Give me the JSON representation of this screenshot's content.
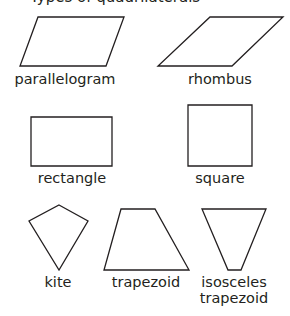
{
  "title": "Types of quadrilaterals",
  "stroke_color": "#231f20",
  "shapes": [
    {
      "name": "parallelogram",
      "label": "parallelogram",
      "points": "38,17 124,17 106,66 20,66",
      "label_x": 65,
      "label_y": 71
    },
    {
      "name": "rhombus",
      "label": "rhombus",
      "points": "210,17 283,17 232,66 158,66",
      "label_x": 220,
      "label_y": 71
    },
    {
      "name": "rectangle",
      "label": "rectangle",
      "points": "31,117 112,117 112,166 31,166",
      "label_x": 72,
      "label_y": 170
    },
    {
      "name": "square",
      "label": "square",
      "points": "188,105 252,105 252,166 188,166",
      "label_x": 220,
      "label_y": 170
    },
    {
      "name": "kite",
      "label": "kite",
      "points": "59,205 88,221 59,270 29,221",
      "label_x": 58,
      "label_y": 274
    },
    {
      "name": "trapezoid",
      "label": "trapezoid",
      "points": "121,209 155,209 189,270 104,270",
      "label_x": 146,
      "label_y": 274
    },
    {
      "name": "isosceles-trapezoid",
      "label_line1": "isosceles",
      "label_line2": "trapezoid",
      "points": "202,209 266,209 241,270 228,270",
      "label_x": 234,
      "label_y": 274
    }
  ]
}
